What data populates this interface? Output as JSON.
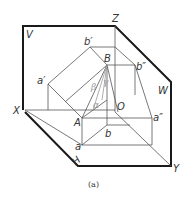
{
  "figure": {
    "caption": "(a)",
    "planes": {
      "V": "V",
      "W": "W",
      "H": "H"
    },
    "axes": {
      "X": "X",
      "Y": "Y",
      "Z": "Z",
      "O": "O"
    },
    "points": {
      "B": "B",
      "A": "A",
      "b_prime": "b′",
      "a_prime": "a′",
      "b_dprime": "b″",
      "a_dprime": "a″",
      "a": "a",
      "b": "b"
    },
    "angles": {
      "alpha": "α",
      "beta": "β",
      "gamma": "γ"
    },
    "colors": {
      "frame": "#1a1a1a",
      "lines": "#555555",
      "angle_lines": "#999999"
    }
  }
}
